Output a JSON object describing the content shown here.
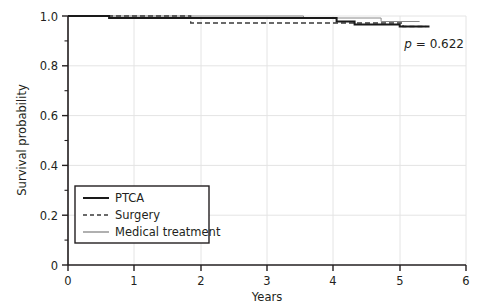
{
  "chart_data": {
    "type": "line",
    "subtype": "kaplan-meier-survival",
    "title": "",
    "xlabel": "Years",
    "ylabel": "Survival probability",
    "xlim": [
      0,
      6
    ],
    "ylim": [
      0,
      1.0
    ],
    "xticks": [
      0,
      1,
      2,
      3,
      4,
      5,
      6
    ],
    "xtick_labels": [
      "0",
      "1",
      "2",
      "3",
      "4",
      "5",
      "6"
    ],
    "yticks": [
      0,
      0.2,
      0.4,
      0.6,
      0.8,
      1.0
    ],
    "ytick_labels": [
      "0",
      "0.2",
      "0.4",
      "0.6",
      "0.8",
      "1.0"
    ],
    "y_minor_ticks": [
      0.1,
      0.3,
      0.5,
      0.7,
      0.9
    ],
    "grid": "both",
    "legend_position": "lower-left",
    "annotations": [
      {
        "name": "p-value",
        "text_italic": "p",
        "text_rest": " = 0.622",
        "full_text": "p = 0.622",
        "x": 5.08,
        "y": 0.865
      }
    ],
    "series": [
      {
        "name": "PTCA",
        "style": "solid",
        "linewidth": 2.0,
        "color": "#1a1a1a",
        "steps": [
          [
            0.0,
            1.0
          ],
          [
            0.62,
            1.0
          ],
          [
            0.62,
            0.992
          ],
          [
            4.05,
            0.992
          ],
          [
            4.05,
            0.978
          ],
          [
            4.32,
            0.978
          ],
          [
            4.32,
            0.966
          ],
          [
            5.0,
            0.966
          ],
          [
            5.0,
            0.958
          ],
          [
            5.45,
            0.958
          ]
        ]
      },
      {
        "name": "Surgery",
        "style": "dashed",
        "linewidth": 1.3,
        "color": "#3a3a3a",
        "steps": [
          [
            0.0,
            1.0
          ],
          [
            1.85,
            1.0
          ],
          [
            1.85,
            0.972
          ],
          [
            5.05,
            0.972
          ],
          [
            5.05,
            0.958
          ],
          [
            5.4,
            0.958
          ]
        ]
      },
      {
        "name": "Medical treatment",
        "style": "solid",
        "linewidth": 1.0,
        "color": "#8a8a8a",
        "steps": [
          [
            0.0,
            1.0
          ],
          [
            3.55,
            1.0
          ],
          [
            3.55,
            0.992
          ],
          [
            4.72,
            0.992
          ],
          [
            4.72,
            0.978
          ],
          [
            5.3,
            0.978
          ]
        ]
      }
    ]
  },
  "legend": {
    "items": [
      {
        "label": "PTCA",
        "style": "solid-thick"
      },
      {
        "label": "Surgery",
        "style": "dashed"
      },
      {
        "label": "Medical treatment",
        "style": "solid-thin"
      }
    ]
  },
  "colors": {
    "axis": "#231f20",
    "grid": "#e2e2e2",
    "ptca": "#1a1a1a",
    "surgery": "#3a3a3a",
    "medical": "#8a8a8a",
    "background": "#ffffff"
  }
}
